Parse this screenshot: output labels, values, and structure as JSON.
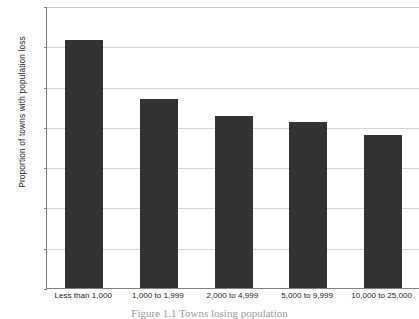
{
  "chart_data": {
    "type": "bar",
    "title": "",
    "xlabel": "",
    "ylabel": "Proportion of towns with population loss",
    "categories": [
      "Less than 1,000",
      "1,000 to 1,999",
      "2,000 to 4,999",
      "5,000 to 9,999",
      "10,000 to 25,000"
    ],
    "values": [
      0.615,
      0.468,
      0.427,
      0.412,
      0.38
    ],
    "ylim": [
      0,
      0.7
    ],
    "ytick_labels": [
      "0.7",
      "0.6",
      "0.5",
      "0.4",
      "0.3",
      "0.2",
      "0.1",
      "0"
    ],
    "ytick_values": [
      0.7,
      0.6,
      0.5,
      0.4,
      0.3,
      0.2,
      0.1,
      0
    ],
    "grid": true,
    "legend": false,
    "legend_position": "none",
    "bar_color": "#333333",
    "gridline_color": "#d4d4d4",
    "axis_color": "#7f7f7f",
    "plot_background": "#ffffff"
  },
  "caption": {
    "text": "Figure 1.1  Towns losing population"
  }
}
